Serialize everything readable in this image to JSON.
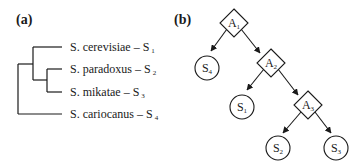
{
  "panel_a": {
    "label": "(a)",
    "species": [
      {
        "name": "S. cerevisiae – S",
        "sub": "1"
      },
      {
        "name": "S. paradoxus – S",
        "sub": "2"
      },
      {
        "name": "S. mikatae – S",
        "sub": "3"
      },
      {
        "name": "S. cariocanus – S",
        "sub": "4"
      }
    ]
  },
  "panel_b": {
    "label": "(b)",
    "decision_nodes": [
      {
        "name": "A",
        "sub": "1"
      },
      {
        "name": "A",
        "sub": "2"
      },
      {
        "name": "A",
        "sub": "3"
      }
    ],
    "leaf_nodes": [
      {
        "name": "S",
        "sub": "4"
      },
      {
        "name": "S",
        "sub": "1"
      },
      {
        "name": "S",
        "sub": "2"
      },
      {
        "name": "S",
        "sub": "3"
      }
    ]
  },
  "colors": {
    "stroke": "#1a1a1a",
    "background": "#ffffff"
  }
}
